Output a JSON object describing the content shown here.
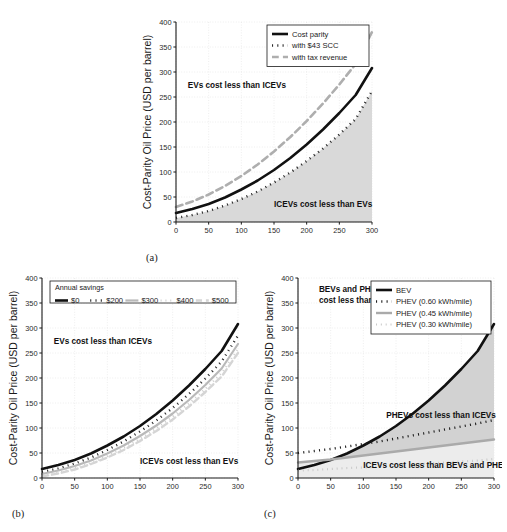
{
  "figure": {
    "width": 507,
    "height": 532,
    "background": "#ffffff",
    "colors": {
      "axis": "#1a1a1a",
      "grid": "#dcdcdc",
      "black_line": "#111111",
      "gray_line": "#b4b4b4",
      "light_gray_line": "#cfcfcf",
      "shade_fill": "#d4d4d4",
      "shade_fill_light": "#e3e3e3",
      "text": "#1a1a1a"
    }
  },
  "panels": [
    {
      "letter": "(a)",
      "xlabel": "Battery Price (USD per kWh)",
      "ylabel": "Cost-Parity Oil Price (USD per barrel)",
      "legend_title": "",
      "annotations": [
        "EVs cost less than ICEVs",
        "ICEVs cost less than EVs"
      ]
    },
    {
      "letter": "(b)",
      "xlabel": "Battery Price (USD per kWh)",
      "ylabel": "Cost-Parity Oil Price (USD per barrel)",
      "legend_title": "Annual savings",
      "annotations": [
        "EVs cost less than ICEVs",
        "ICEVs cost less than EVs"
      ]
    },
    {
      "letter": "(c)",
      "xlabel": "Battery Price (USD per kWh)",
      "ylabel": "Cost-Parity Oil Price (USD per barrel)",
      "legend_title": "",
      "annotations": [
        "BEVs and PHEVs",
        "cost less than ICEVs",
        "PHEVs cost less than ICEVs",
        "ICEVs cost less than BEVs and PHEVs"
      ]
    }
  ],
  "chart_data": [
    {
      "type": "line",
      "panel": "(a)",
      "title": "",
      "xlabel": "Battery Price (USD per kWh)",
      "ylabel": "Cost-Parity Oil Price (USD per barrel)",
      "xlim": [
        0,
        300
      ],
      "ylim": [
        0,
        400
      ],
      "xticks": [
        0,
        50,
        100,
        150,
        200,
        250,
        300
      ],
      "yticks": [
        0,
        50,
        100,
        150,
        200,
        250,
        300,
        350,
        400
      ],
      "grid": true,
      "legend_position": "top-right",
      "x": [
        0,
        25,
        50,
        75,
        100,
        125,
        150,
        175,
        200,
        225,
        250,
        275,
        300
      ],
      "series": [
        {
          "name": "Cost parity",
          "style": "solid",
          "color": "#111111",
          "width": 2.6,
          "values": [
            18,
            26,
            36,
            49,
            65,
            83,
            104,
            128,
            155,
            185,
            218,
            254,
            308
          ]
        },
        {
          "name": "with $43 SCC",
          "style": "dotted",
          "color": "#2a2a2a",
          "width": 2.4,
          "values": [
            8,
            14,
            22,
            33,
            46,
            61,
            79,
            99,
            122,
            147,
            175,
            206,
            262
          ]
        },
        {
          "name": "with tax revenue",
          "style": "dashed",
          "color": "#aeaeae",
          "width": 2.6,
          "values": [
            30,
            41,
            55,
            72,
            92,
            115,
            141,
            170,
            202,
            237,
            275,
            316,
            380
          ]
        }
      ],
      "shaded_regions": [
        {
          "between": "with $43 SCC",
          "and": "x-axis",
          "fill": "#d9d9d9",
          "label": "ICEVs cost less than EVs"
        }
      ],
      "annotations": [
        {
          "text": "EVs cost less than ICEVs",
          "x": 18,
          "y": 268
        },
        {
          "text": "ICEVs cost less than EVs",
          "x": 150,
          "y": 30
        }
      ]
    },
    {
      "type": "line",
      "panel": "(b)",
      "title": "",
      "xlabel": "Battery Price (USD per kWh)",
      "ylabel": "Cost-Parity Oil Price (USD per barrel)",
      "xlim": [
        0,
        300
      ],
      "ylim": [
        0,
        400
      ],
      "xticks": [
        0,
        50,
        100,
        150,
        200,
        250,
        300
      ],
      "yticks": [
        0,
        50,
        100,
        150,
        200,
        250,
        300,
        350,
        400
      ],
      "grid": true,
      "legend_title": "Annual savings",
      "legend_position": "top",
      "x": [
        0,
        25,
        50,
        75,
        100,
        125,
        150,
        175,
        200,
        225,
        250,
        275,
        300
      ],
      "series": [
        {
          "name": "$0",
          "style": "solid",
          "color": "#111111",
          "width": 2.6,
          "values": [
            18,
            26,
            36,
            49,
            65,
            83,
            104,
            128,
            155,
            185,
            218,
            254,
            308
          ]
        },
        {
          "name": "$200",
          "style": "dotted",
          "color": "#2a2a2a",
          "width": 2.4,
          "values": [
            12,
            19,
            29,
            41,
            56,
            73,
            93,
            115,
            140,
            168,
            199,
            233,
            285
          ]
        },
        {
          "name": "$300",
          "style": "solid",
          "color": "#b9b9b9",
          "width": 2.2,
          "values": [
            8,
            15,
            24,
            35,
            49,
            65,
            84,
            105,
            129,
            156,
            186,
            219,
            268
          ]
        },
        {
          "name": "$400",
          "style": "dotted",
          "color": "#cdcdcd",
          "width": 2.2,
          "values": [
            5,
            11,
            20,
            31,
            44,
            60,
            78,
            99,
            123,
            149,
            178,
            210,
            258
          ]
        },
        {
          "name": "$500",
          "style": "dashed",
          "color": "#d5d5d5",
          "width": 2.4,
          "values": [
            3,
            9,
            17,
            28,
            41,
            56,
            74,
            94,
            117,
            143,
            172,
            203,
            250
          ]
        }
      ],
      "annotations": [
        {
          "text": "EVs cost less than ICEVs",
          "x": 18,
          "y": 268
        },
        {
          "text": "ICEVs cost less than EVs",
          "x": 150,
          "y": 28
        }
      ]
    },
    {
      "type": "line",
      "panel": "(c)",
      "title": "",
      "xlabel": "Battery Price (USD per kWh)",
      "ylabel": "Cost-Parity Oil Price (USD per barrel)",
      "xlim": [
        0,
        300
      ],
      "ylim": [
        0,
        400
      ],
      "xticks": [
        0,
        50,
        100,
        150,
        200,
        250,
        300
      ],
      "yticks": [
        0,
        50,
        100,
        150,
        200,
        250,
        300,
        350,
        400
      ],
      "grid": true,
      "legend_position": "top-right",
      "x": [
        0,
        25,
        50,
        75,
        100,
        125,
        150,
        175,
        200,
        225,
        250,
        275,
        300
      ],
      "series": [
        {
          "name": "BEV",
          "style": "solid",
          "color": "#111111",
          "width": 2.6,
          "values": [
            18,
            26,
            36,
            49,
            65,
            83,
            104,
            128,
            155,
            185,
            218,
            254,
            308
          ]
        },
        {
          "name": "PHEV (0.60 kWh/mile)",
          "style": "dotted",
          "color": "#1d1d1d",
          "width": 2.4,
          "values": [
            50,
            54,
            58,
            63,
            68,
            73,
            79,
            85,
            91,
            97,
            103,
            109,
            116
          ]
        },
        {
          "name": "PHEV (0.45 kWh/mile)",
          "style": "solid",
          "color": "#aaaaaa",
          "width": 2.4,
          "values": [
            31,
            34,
            37,
            41,
            45,
            49,
            53,
            57,
            61,
            65,
            69,
            73,
            77
          ]
        },
        {
          "name": "PHEV (0.30 kWh/mile)",
          "style": "dotted",
          "color": "#c9c9c9",
          "width": 2.2,
          "values": [
            15,
            16,
            18,
            20,
            21,
            23,
            25,
            27,
            29,
            31,
            33,
            35,
            38
          ]
        }
      ],
      "shaded_regions": [
        {
          "between": "BEV",
          "and": "PHEV (0.45 kWh/mile)",
          "fill": "#d2d2d2",
          "label": "PHEVs cost less than ICEVs"
        },
        {
          "between": "PHEV (0.45 kWh/mile)",
          "and": "x-axis",
          "fill": "#ececec",
          "label": "ICEVs cost less than BEVs and PHEVs"
        }
      ],
      "annotations": [
        {
          "text": "BEVs and PHEVs",
          "x": 32,
          "y": 372
        },
        {
          "text": "cost less than ICEVs",
          "x": 32,
          "y": 350
        },
        {
          "text": "PHEVs cost less than ICEVs",
          "x": 135,
          "y": 120
        },
        {
          "text": "ICEVs cost less than BEVs and PHEVs",
          "x": 100,
          "y": 20
        }
      ]
    }
  ]
}
